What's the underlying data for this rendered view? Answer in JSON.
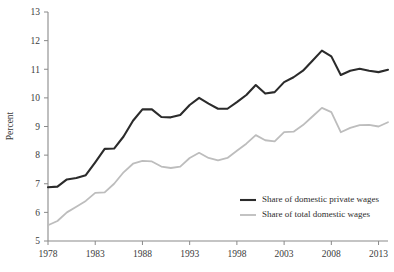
{
  "chart_data": {
    "type": "line",
    "title": "",
    "subtitle": "",
    "xlabel": "",
    "ylabel": "Percent",
    "xlim": [
      1978,
      2014
    ],
    "ylim": [
      5,
      13
    ],
    "grid": false,
    "legend_position": "bottom-right",
    "x_ticks": [
      "1978",
      "1983",
      "1988",
      "1993",
      "1998",
      "2003",
      "2008",
      "2013"
    ],
    "x_tick_values": [
      1978,
      1983,
      1988,
      1993,
      1998,
      2003,
      2008,
      2013
    ],
    "y_ticks": [
      "5",
      "6",
      "7",
      "8",
      "9",
      "10",
      "11",
      "12",
      "13"
    ],
    "y_tick_values": [
      5,
      6,
      7,
      8,
      9,
      10,
      11,
      12,
      13
    ],
    "x": [
      1978,
      1979,
      1980,
      1981,
      1982,
      1983,
      1984,
      1985,
      1986,
      1987,
      1988,
      1989,
      1990,
      1991,
      1992,
      1993,
      1994,
      1995,
      1996,
      1997,
      1998,
      1999,
      2000,
      2001,
      2002,
      2003,
      2004,
      2005,
      2006,
      2007,
      2008,
      2009,
      2010,
      2011,
      2012,
      2013,
      2014
    ],
    "series": [
      {
        "name": "Share of domestic private wages",
        "color": "#2b2b2b",
        "width": 2.1,
        "values": [
          6.88,
          6.9,
          7.15,
          7.2,
          7.3,
          7.75,
          8.22,
          8.23,
          8.65,
          9.2,
          9.6,
          9.6,
          9.33,
          9.32,
          9.4,
          9.75,
          10.0,
          9.8,
          9.62,
          9.62,
          9.85,
          10.1,
          10.45,
          10.15,
          10.2,
          10.55,
          10.72,
          10.95,
          11.3,
          11.65,
          11.45,
          10.8,
          10.95,
          11.02,
          10.95,
          10.9,
          10.98
        ]
      },
      {
        "name": "Share of total domestic wages",
        "color": "#bdbdbd",
        "width": 1.8,
        "values": [
          5.55,
          5.7,
          6.0,
          6.2,
          6.4,
          6.68,
          6.7,
          7.0,
          7.4,
          7.7,
          7.8,
          7.78,
          7.6,
          7.55,
          7.6,
          7.9,
          8.08,
          7.9,
          7.82,
          7.9,
          8.15,
          8.4,
          8.7,
          8.52,
          8.48,
          8.8,
          8.82,
          9.05,
          9.35,
          9.65,
          9.5,
          8.8,
          8.95,
          9.05,
          9.06,
          9.0,
          9.15
        ]
      }
    ]
  }
}
